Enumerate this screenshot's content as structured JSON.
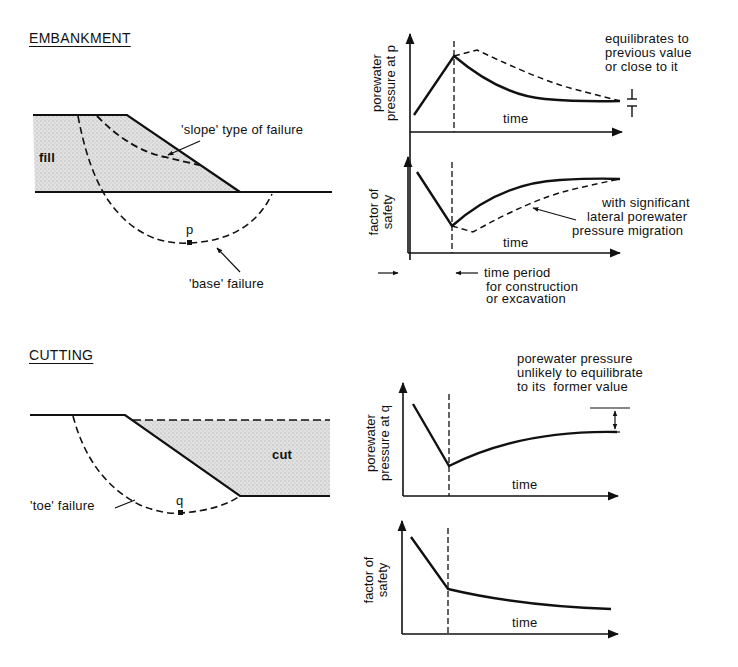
{
  "embankment": {
    "heading": "EMBANKMENT",
    "labels": {
      "fill": "fill",
      "slope_failure": "'slope' type of failure",
      "base_failure": "'base' failure",
      "point": "p"
    },
    "graph_pressure": {
      "ylabel_line1": "porewater",
      "ylabel_line2": "pressure at p",
      "xlabel": "time",
      "annotation_line1": "equilibrates to",
      "annotation_line2": "previous value",
      "annotation_line3": "or close to it"
    },
    "graph_safety": {
      "ylabel_line1": "factor of",
      "ylabel_line2": "safety",
      "xlabel": "time",
      "annotation_line1": "with significant",
      "annotation_line2": "lateral porewater",
      "annotation_line3": "pressure migration"
    },
    "time_period_line1": "time period",
    "time_period_line2": "for construction",
    "time_period_line3": "or excavation"
  },
  "cutting": {
    "heading": "CUTTING",
    "labels": {
      "cut": "cut",
      "toe_failure": "'toe' failure",
      "point": "q"
    },
    "graph_pressure": {
      "ylabel_line1": "porewater",
      "ylabel_line2": "pressure at q",
      "xlabel": "time",
      "annotation_line1": "porewater pressure",
      "annotation_line2": "unlikely to equilibrate",
      "annotation_line3": "to its  former value"
    },
    "graph_safety": {
      "ylabel_line1": "factor of",
      "ylabel_line2": "safety",
      "xlabel": "time"
    }
  },
  "colors": {
    "ink": "#111111",
    "stipple": "#d4d4d4",
    "background": "#ffffff"
  }
}
